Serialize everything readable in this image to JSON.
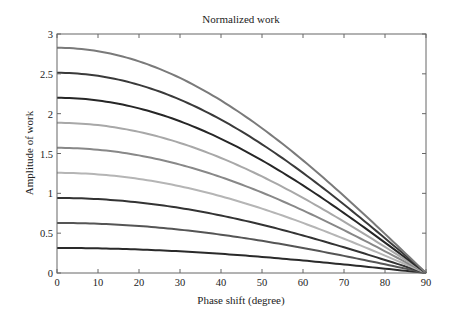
{
  "chart_data": {
    "type": "line",
    "title": "Normalized work",
    "xlabel": "Phase shift (degree)",
    "ylabel": "Amplitude of work",
    "xlim": [
      0,
      90
    ],
    "ylim": [
      0,
      3
    ],
    "xticks": [
      0,
      10,
      20,
      30,
      40,
      50,
      60,
      70,
      80,
      90
    ],
    "yticks": [
      0,
      0.5,
      1,
      1.5,
      2,
      2.5,
      3
    ],
    "ytick_labels": [
      "0",
      "0.5",
      "1",
      "1.5",
      "2",
      "2.5",
      "3"
    ],
    "grid": false,
    "legend": null,
    "x": [
      0,
      10,
      20,
      30,
      40,
      50,
      60,
      70,
      80,
      90
    ],
    "series": [
      {
        "name": "curve-1",
        "color": "#2a2a2a",
        "amplitude": 0.314,
        "values": [
          0.314,
          0.309,
          0.295,
          0.272,
          0.241,
          0.202,
          0.157,
          0.107,
          0.055,
          0.0
        ]
      },
      {
        "name": "curve-2",
        "color": "#555555",
        "amplitude": 0.628,
        "values": [
          0.628,
          0.619,
          0.59,
          0.544,
          0.481,
          0.404,
          0.314,
          0.215,
          0.109,
          0.0
        ]
      },
      {
        "name": "curve-3",
        "color": "#333333",
        "amplitude": 0.942,
        "values": [
          0.942,
          0.928,
          0.885,
          0.816,
          0.722,
          0.606,
          0.471,
          0.322,
          0.164,
          0.0
        ]
      },
      {
        "name": "curve-4",
        "color": "#b5b5b5",
        "amplitude": 1.257,
        "values": [
          1.257,
          1.238,
          1.181,
          1.088,
          0.963,
          0.808,
          0.628,
          0.43,
          0.218,
          0.0
        ]
      },
      {
        "name": "curve-5",
        "color": "#888888",
        "amplitude": 1.571,
        "values": [
          1.571,
          1.547,
          1.476,
          1.36,
          1.203,
          1.01,
          0.785,
          0.537,
          0.273,
          0.0
        ]
      },
      {
        "name": "curve-6",
        "color": "#a8a8a8",
        "amplitude": 1.885,
        "values": [
          1.885,
          1.856,
          1.771,
          1.632,
          1.444,
          1.212,
          0.942,
          0.645,
          0.327,
          0.0
        ]
      },
      {
        "name": "curve-7",
        "color": "#262626",
        "amplitude": 2.199,
        "values": [
          2.199,
          2.166,
          2.066,
          1.904,
          1.685,
          1.414,
          1.1,
          0.752,
          0.382,
          0.0
        ]
      },
      {
        "name": "curve-8",
        "color": "#3a3a3a",
        "amplitude": 2.513,
        "values": [
          2.513,
          2.475,
          2.362,
          2.177,
          1.925,
          1.616,
          1.257,
          0.86,
          0.436,
          0.0
        ]
      },
      {
        "name": "curve-9",
        "color": "#7a7a7a",
        "amplitude": 2.827,
        "values": [
          2.827,
          2.784,
          2.657,
          2.449,
          2.166,
          1.817,
          1.414,
          0.967,
          0.491,
          0.0
        ]
      }
    ]
  },
  "layout": {
    "plot_left": 57,
    "plot_top": 34,
    "plot_right": 426,
    "plot_bottom": 273,
    "axis_color": "#666666"
  }
}
